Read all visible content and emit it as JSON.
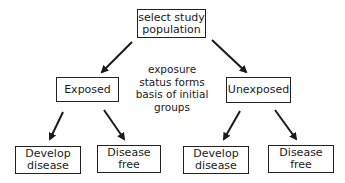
{
  "diagram": {
    "root": {
      "label_line1": "select study",
      "label_line2": "population"
    },
    "note": {
      "line1": "exposure",
      "line2": "status forms",
      "line3": "basis of initial",
      "line4": "groups"
    },
    "groups": [
      {
        "label": "Exposed"
      },
      {
        "label": "Unexposed"
      }
    ],
    "outcomes": [
      {
        "line1": "Develop",
        "line2": "disease"
      },
      {
        "line1": "Disease",
        "line2": "free"
      },
      {
        "line1": "Develop",
        "line2": "disease"
      },
      {
        "line1": "Disease",
        "line2": "free"
      }
    ],
    "edges": [
      {
        "from": "root",
        "to": "Exposed"
      },
      {
        "from": "root",
        "to": "Unexposed"
      },
      {
        "from": "Exposed",
        "to": "Develop disease"
      },
      {
        "from": "Exposed",
        "to": "Disease free"
      },
      {
        "from": "Unexposed",
        "to": "Develop disease"
      },
      {
        "from": "Unexposed",
        "to": "Disease free"
      }
    ]
  }
}
